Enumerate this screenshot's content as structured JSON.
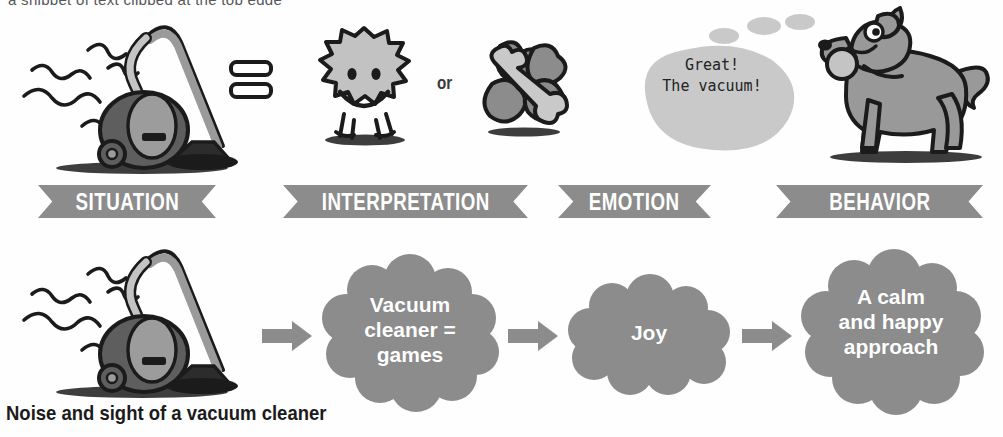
{
  "page": {
    "title_clipped": "a snippet of text clipped at the top edge",
    "bottom_caption": "Noise and sight of a vacuum cleaner",
    "background_color": "#ffffff"
  },
  "colors": {
    "banner_grey": "#8c8c8c",
    "cloud_grey": "#8c8c8c",
    "arrow_grey": "#8c8c8c",
    "bubble_grey": "#c9c9c9",
    "dog_grey": "#999999",
    "vacuum_dark": "#5e5e5e",
    "vacuum_light": "#b0b0b0",
    "outline_black": "#1b1b1b",
    "label_white": "#ffffff",
    "text_dark": "#222222"
  },
  "banners": [
    {
      "label": "SITUATION",
      "name": "situation"
    },
    {
      "label": "INTERPRETATION",
      "name": "interpretation"
    },
    {
      "label": "EMOTION",
      "name": "emotion"
    },
    {
      "label": "BEHAVIOR",
      "name": "behavior"
    }
  ],
  "top_row": {
    "situation_icon": "vacuum-cleaner-with-noise-squiggles",
    "equals_sign": "=",
    "interpretation_icons": [
      {
        "name": "smiley-blob-icon",
        "meaning": "happy spiky blob with smiling face"
      },
      {
        "name": "bone-and-clover-icon",
        "meaning": "bone over clover shape"
      }
    ],
    "or_label": "or",
    "emotion_bubble": {
      "name": "thought-bubble",
      "text": "Great!\nThe vacuum!",
      "trail_dots": 3
    },
    "behavior_icon": "dog-with-ball-in-mouth"
  },
  "bottom_row": {
    "situation_icon": "vacuum-cleaner-with-noise-squiggles",
    "arrows": [
      "arrow-1",
      "arrow-2",
      "arrow-3"
    ],
    "clouds": [
      {
        "name": "interpretation-cloud",
        "text": "Vacuum\ncleaner =\ngames",
        "font_size": 21
      },
      {
        "name": "emotion-cloud",
        "text": "Joy",
        "font_size": 21
      },
      {
        "name": "behavior-cloud",
        "text": "A calm\nand happy\napproach",
        "font_size": 21
      }
    ]
  }
}
